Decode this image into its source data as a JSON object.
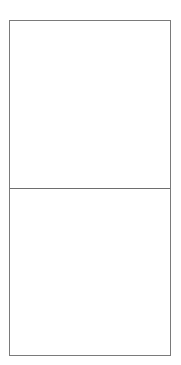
{
  "frame": {
    "border_color": "#7a7a7a",
    "panels": [
      {
        "id": "top",
        "content": ""
      },
      {
        "id": "bottom",
        "content": ""
      }
    ]
  }
}
